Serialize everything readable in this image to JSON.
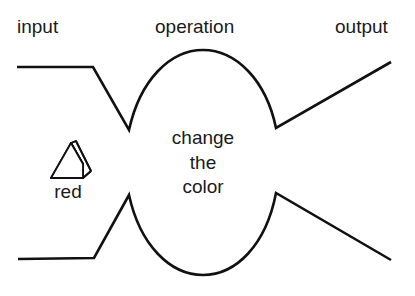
{
  "diagram": {
    "headers": {
      "input": "input",
      "operation": "operation",
      "output": "output"
    },
    "operation_text": {
      "line1": "change",
      "line2": "the",
      "line3": "color"
    },
    "input_object": {
      "icon": "triangle-prism-icon",
      "label": "red"
    },
    "colors": {
      "stroke": "#111111",
      "text": "#1a1a1a",
      "background": "#ffffff"
    }
  }
}
